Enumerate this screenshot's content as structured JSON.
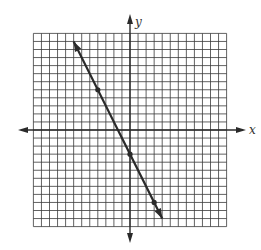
{
  "chart_data": {
    "type": "line",
    "title": "",
    "xlabel": "x",
    "ylabel": "y",
    "xlim": [
      -12,
      12
    ],
    "ylim": [
      -12,
      12
    ],
    "grid": true,
    "grid_step": 1,
    "legend": null,
    "series": [
      {
        "name": "y = -2x - 3",
        "equation": "y = -2x - 3",
        "slope": -2,
        "intercept": -3,
        "marked_points": [
          [
            -4,
            5
          ],
          [
            0,
            -3
          ],
          [
            3,
            -9
          ]
        ],
        "segment": [
          [
            -7,
            11
          ],
          [
            4,
            -11
          ]
        ],
        "arrows_both_ends": true
      }
    ]
  },
  "labels": {
    "x_axis": "x",
    "y_axis": "y"
  },
  "colors": {
    "grid": "#3a3a3a",
    "axis": "#2a2a2a",
    "line": "#2a2a2a",
    "background": "#ffffff"
  }
}
